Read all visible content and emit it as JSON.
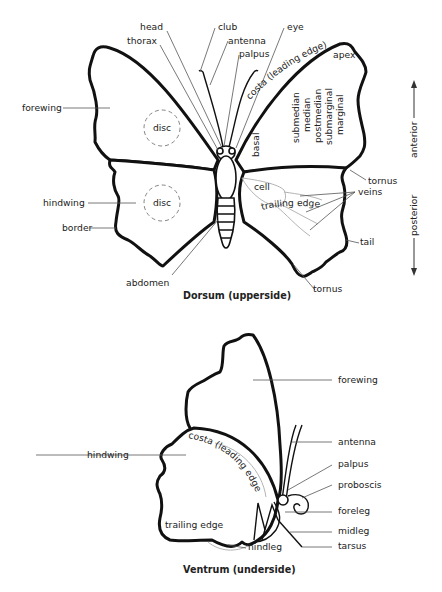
{
  "dorsum": {
    "caption": "Dorsum (upperside)",
    "labels": {
      "head": "head",
      "thorax": "thorax",
      "club": "club",
      "antenna": "antenna",
      "palpus": "palpus",
      "eye": "eye",
      "costa": "costa (leading edge)",
      "apex": "apex",
      "forewing": "forewing",
      "disc_fore": "disc",
      "disc_hind": "disc",
      "basal": "basal",
      "submedian": "submedian",
      "median": "median",
      "postmedian": "postmedian",
      "submarginal": "submarginal",
      "marginal": "marginal",
      "trailing_edge": "trailing edge",
      "tornus_fore": "tornus",
      "cell": "cell",
      "veins": "veins",
      "hindwing": "hindwing",
      "border": "border",
      "tail": "tail",
      "abdomen": "abdomen",
      "tornus_hind": "tornus"
    },
    "orientation": {
      "anterior": "anterior",
      "posterior": "posterior"
    }
  },
  "ventrum": {
    "caption": "Ventrum (underside)",
    "labels": {
      "forewing": "forewing",
      "antenna": "antenna",
      "palpus": "palpus",
      "proboscis": "proboscis",
      "foreleg": "foreleg",
      "midleg": "midleg",
      "tarsus": "tarsus",
      "hindwing": "hindwing",
      "costa": "costa (leading edge)",
      "trailing_edge": "trailing edge",
      "hindleg": "hindleg"
    }
  }
}
